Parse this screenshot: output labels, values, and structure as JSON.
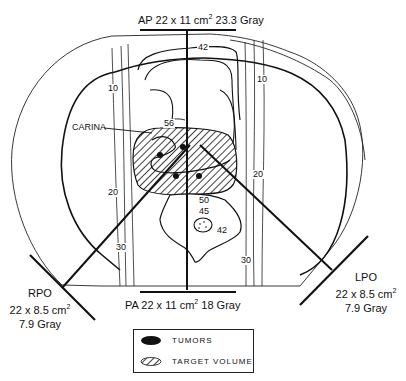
{
  "diagram": {
    "type": "radiation-therapy-isodose-plan",
    "beams": {
      "ap": {
        "name": "AP",
        "size": "22 x 11 cm",
        "size_sup": "2",
        "dose": "23.3 Gray"
      },
      "pa": {
        "name": "PA",
        "size": "22 x 11 cm",
        "size_sup": "2",
        "dose": "18 Gray"
      },
      "rpo": {
        "name": "RPO",
        "size": "22 x 8.5 cm",
        "size_sup": "2",
        "dose": "7.9 Gray"
      },
      "lpo": {
        "name": "LPO",
        "size": "22 x 8.5 cm",
        "size_sup": "2",
        "dose": "7.9 Gray"
      }
    },
    "annotations": {
      "carina": "CARINA"
    },
    "isodose_labels": {
      "top_42": "42",
      "left_10": "10",
      "right_10": "10",
      "center_56": "56",
      "left_20": "20",
      "right_20": "20",
      "spine_50": "50",
      "spine_45": "45",
      "spine_42": "42",
      "left_30": "30",
      "right_30": "30"
    },
    "legend": {
      "items": [
        {
          "label": "TUMORS",
          "swatch": "solid-ellipse"
        },
        {
          "label": "TARGET VOLUME",
          "swatch": "hatched-ellipse"
        }
      ]
    },
    "colors": {
      "ink": "#111111",
      "background": "#ffffff"
    }
  }
}
